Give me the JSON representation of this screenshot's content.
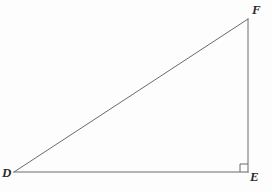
{
  "figure": {
    "name": "right-triangle-DEF",
    "background_color": "#fdfdfd",
    "stroke_color": "#6a6a6a",
    "label_color": "#2b2b2b",
    "stroke_width": 1,
    "width": 272,
    "height": 192,
    "vertices": [
      {
        "id": "D",
        "label": "D",
        "x": 14,
        "y": 172
      },
      {
        "id": "E",
        "label": "E",
        "x": 248,
        "y": 172
      },
      {
        "id": "F",
        "label": "F",
        "x": 248,
        "y": 19
      }
    ],
    "sides": [
      {
        "id": "DE",
        "from": "D",
        "to": "E",
        "name": "base-segment-DE"
      },
      {
        "id": "EF",
        "from": "E",
        "to": "F",
        "name": "vertical-segment-EF"
      },
      {
        "id": "FD",
        "from": "F",
        "to": "D",
        "name": "hypotenuse-segment-FD"
      }
    ],
    "right_angle": {
      "at_vertex": "E",
      "marker": "square",
      "size": 8
    }
  }
}
